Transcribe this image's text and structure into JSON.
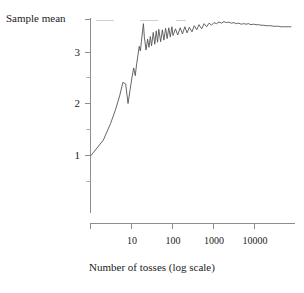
{
  "chart_data": {
    "type": "line",
    "title": "",
    "xlabel": "Number of tosses (log scale)",
    "ylabel": "Sample mean",
    "xscale": "log",
    "xlim": [
      1,
      100000
    ],
    "ylim": [
      0.3,
      3.63
    ],
    "grid": false,
    "legend": null,
    "reference_line": {
      "label": "",
      "value": 3.5,
      "style": "faint-broken-horizontal"
    },
    "x_ticks": [
      {
        "value": 10,
        "label": "10"
      },
      {
        "value": 100,
        "label": "100"
      },
      {
        "value": 1000,
        "label": "1000"
      },
      {
        "value": 10000,
        "label": "10000"
      }
    ],
    "y_ticks": [
      {
        "value": 1,
        "label": "1"
      },
      {
        "value": 2,
        "label": "2"
      },
      {
        "value": 3,
        "label": "3"
      }
    ],
    "y_minor_ticks": [
      0.5,
      1.5,
      2.5,
      3.5
    ],
    "series": [
      {
        "name": "Running sample mean of die tosses",
        "x": [
          1,
          2,
          3,
          4,
          5,
          6,
          7,
          8,
          9,
          10,
          11,
          12,
          13,
          14,
          15,
          16,
          17,
          18,
          19,
          20,
          22,
          24,
          26,
          28,
          30,
          33,
          36,
          39,
          42,
          45,
          50,
          55,
          60,
          66,
          72,
          79,
          86,
          94,
          100,
          115,
          130,
          150,
          170,
          195,
          220,
          250,
          290,
          330,
          380,
          430,
          500,
          575,
          660,
          760,
          870,
          1000,
          1150,
          1320,
          1520,
          1750,
          2000,
          2300,
          2650,
          3050,
          3500,
          4000,
          4600,
          5300,
          6100,
          7000,
          8000,
          9200,
          10600,
          12200,
          14000,
          16100,
          18500,
          21300,
          24500,
          28200,
          32400,
          37300,
          42900,
          49300,
          56700,
          65200,
          75000
        ],
        "y": [
          1.0,
          1.3,
          1.62,
          1.9,
          2.16,
          2.42,
          2.39,
          2.01,
          2.28,
          2.52,
          2.7,
          2.55,
          2.78,
          2.95,
          3.12,
          3.03,
          3.22,
          3.4,
          3.56,
          3.3,
          3.05,
          3.26,
          3.1,
          3.31,
          3.13,
          3.39,
          3.16,
          3.42,
          3.2,
          3.45,
          3.21,
          3.44,
          3.24,
          3.47,
          3.27,
          3.48,
          3.3,
          3.5,
          3.33,
          3.46,
          3.34,
          3.48,
          3.36,
          3.5,
          3.38,
          3.49,
          3.4,
          3.52,
          3.44,
          3.54,
          3.46,
          3.56,
          3.5,
          3.57,
          3.53,
          3.58,
          3.56,
          3.59,
          3.57,
          3.6,
          3.58,
          3.59,
          3.57,
          3.58,
          3.56,
          3.57,
          3.55,
          3.56,
          3.55,
          3.56,
          3.54,
          3.55,
          3.54,
          3.54,
          3.53,
          3.53,
          3.52,
          3.52,
          3.52,
          3.51,
          3.51,
          3.51,
          3.5,
          3.5,
          3.5,
          3.5,
          3.5
        ]
      }
    ]
  },
  "axes": {
    "y_title": "Sample mean",
    "x_title": "Number of tosses (log scale)"
  },
  "colors": {
    "line": "#555555",
    "axis": "#888888",
    "text": "#222222",
    "reference": "#cccccc",
    "background": "#ffffff"
  }
}
